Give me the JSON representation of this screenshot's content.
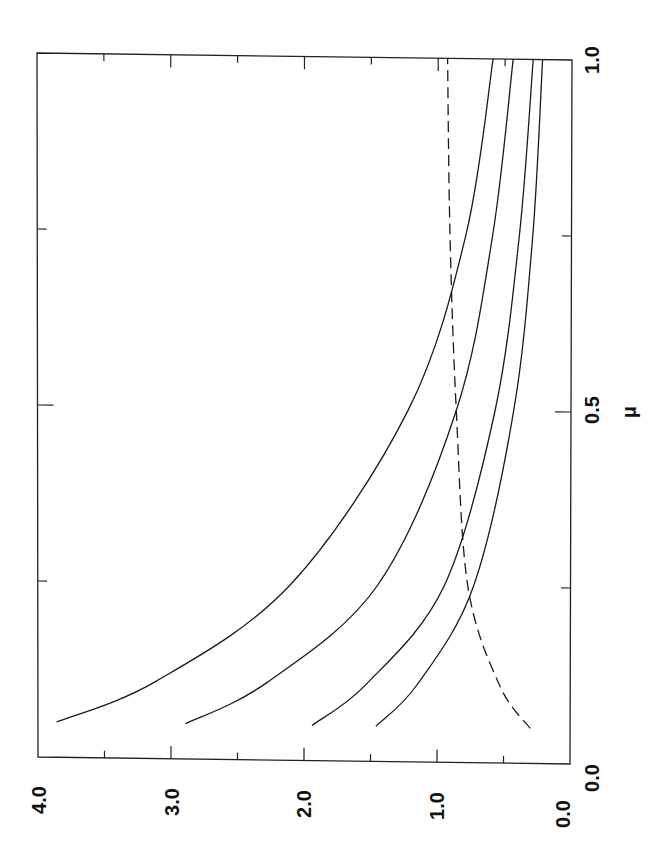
{
  "chart_data": {
    "type": "line",
    "title": "",
    "orientation": "rotated 90° counter-clockwise on page (x axis runs bottom→top along right edge, y axis values read along bottom edge, decreasing to the right)",
    "xlabel": "μ",
    "ylabel": "",
    "xlim": [
      0.0,
      1.0
    ],
    "ylim": [
      0.0,
      4.0
    ],
    "x_ticks": [
      0.0,
      0.5,
      1.0
    ],
    "x_tick_labels": [
      "0.0",
      "0.5",
      "1.0"
    ],
    "x_minor_ticks": [
      0.25,
      0.75
    ],
    "y_ticks": [
      0.0,
      1.0,
      2.0,
      3.0,
      4.0
    ],
    "y_tick_labels": [
      "0.0",
      "1.0",
      "2.0",
      "3.0",
      "4.0"
    ],
    "y_minor_ticks": [
      0.5,
      1.5,
      2.5,
      3.5
    ],
    "grid": false,
    "legend": null,
    "x": [
      0.05,
      0.11,
      0.25,
      0.5,
      0.75,
      1.0
    ],
    "series": [
      {
        "name": "curve 1",
        "style": "solid",
        "values": [
          3.86,
          3.11,
          2.1,
          1.22,
          0.79,
          0.59
        ]
      },
      {
        "name": "curve 2",
        "style": "solid",
        "values": [
          2.89,
          2.28,
          1.45,
          0.86,
          0.59,
          0.44
        ]
      },
      {
        "name": "curve 3",
        "style": "solid",
        "values": [
          1.94,
          1.53,
          0.95,
          0.57,
          0.39,
          0.29
        ]
      },
      {
        "name": "curve 4",
        "style": "solid",
        "values": [
          1.46,
          1.15,
          0.73,
          0.43,
          0.29,
          0.22
        ]
      },
      {
        "name": "dashed curve",
        "style": "dashed",
        "values": [
          0.3,
          0.53,
          0.77,
          0.86,
          0.91,
          0.93
        ]
      }
    ]
  },
  "labels": {
    "x_axis_label": "μ",
    "x_tick_0": "0.0",
    "x_tick_05": "0.5",
    "x_tick_1": "1.0",
    "y_tick_0": "0.0",
    "y_tick_1": "1.0",
    "y_tick_2": "2.0",
    "y_tick_3": "3.0",
    "y_tick_4": "4.0"
  }
}
